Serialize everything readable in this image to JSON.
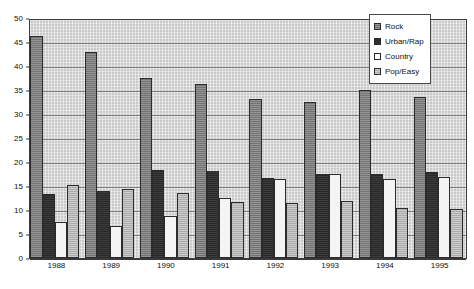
{
  "chart_data": {
    "type": "bar",
    "title": "",
    "subtitle": "",
    "xlabel": "",
    "ylabel": "",
    "categories": [
      "1988",
      "1989",
      "1990",
      "1991",
      "1992",
      "1993",
      "1994",
      "1995"
    ],
    "series": [
      {
        "name": "Rock",
        "color": "#808080",
        "values": [
          46.2,
          42.9,
          37.4,
          36.3,
          33.2,
          32.6,
          35.1,
          33.6
        ]
      },
      {
        "name": "Urban/Rap",
        "color": "#2e2e2e",
        "values": [
          13.3,
          14.0,
          18.3,
          18.1,
          16.7,
          17.6,
          17.5,
          18.0
        ]
      },
      {
        "name": "Country",
        "color": "#f4f4f4",
        "values": [
          7.4,
          6.7,
          8.8,
          12.5,
          16.5,
          17.5,
          16.4,
          16.8
        ]
      },
      {
        "name": "Pop/Easy",
        "color": "#b6b6b6",
        "values": [
          15.2,
          14.4,
          13.6,
          11.7,
          11.5,
          11.9,
          10.5,
          10.3
        ]
      }
    ],
    "ylim": [
      0,
      50
    ],
    "yticks": [
      0,
      5,
      10,
      15,
      20,
      25,
      30,
      35,
      40,
      45,
      50
    ],
    "ytick_labels": [
      "0",
      "5",
      "10",
      "15",
      "20",
      "25",
      "30",
      "35",
      "40",
      "45",
      "50"
    ],
    "grid": true,
    "grid_axis": "y",
    "legend": {
      "position": "top-right",
      "entries": [
        "Rock",
        "Urban/Rap",
        "Country",
        "Pop/Easy"
      ]
    },
    "plot_background": "#d2d2d2",
    "figure_background": "#ffffff"
  }
}
